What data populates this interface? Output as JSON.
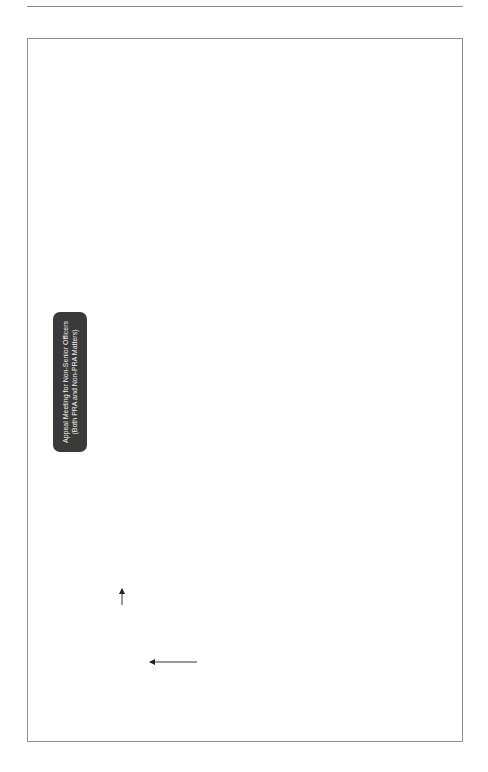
{
  "title": "Appeal Meeting for Non-Senior Officers\n(Both PRA and Non-PRA Matters)",
  "notes_label": "Notes",
  "edge_labels": {
    "yes": "Yes",
    "no": "No",
    "not_upheld": "Not upheld",
    "upheld": "Upheld"
  },
  "boxes": {
    "start": "Within 7WD of receipt of \"notice and summary of reasons notifying of outcome\" officer to give written notice of appeal to AA stating:\na) grounds for appeal (with details) and\nb) whether an appeal meeting is requested\nReg 38(1) PCR",
    "start_note": "* Officer has right of appeal against finding and/or outcome imposed at meeting\n* Grounds of appeal are:\na) Finding or disciplinary action was unreasonable\nb) Evidence that could not reasonably have been considered at the MC meeting\nc) Serious breach of the procedures/unfairness\n* Written notice must include details of why above applies\nReg 38(2) PCR\n2.230 - 2.233 G",
    "aa_appoints": "AA appoints person to conduct Appeal Meeting\nReg 38(4) PCR",
    "aa_appoints_note": "* Higher rank or more senior police staff member than that which heard the meeting\n* See additional rules under Reg 38(4) PCR\n* Police officer or police staff can be appointed to advise on procedural matters\n2.234 - 2.235 G",
    "aa_asap": "AA ASAP to give officer written notice of:\na) person appointed to conduct Appeal Meeting and\nb) any person appointed to advise\nReg 38(5) PCR",
    "officer_object": "Officer may object in writing (giving reasons) to AA within 3WD of notification) to:\na) person appointed to conduct appeal meeting or\nb) advisor\nReg 38(6) PCR",
    "officer_object_note": "Officer must provide clear and reasonable objections",
    "aa_decide": "AA to decide whether to uphold objection\nReg 38(8) PCR",
    "aa_replace": "AA to replace person and notify officer of the new persons name asap\nReg 38(9) PCR",
    "aa_notify_refusal": "AA to notify officer of refusal to uphold objection",
    "determine_arguable": "Person determining appeal determines whether the appeal sets out arguable grounds\nReg 39(2) PCR\n2.237 - 2.239 G",
    "dismiss": "Dismiss appeal\nReg 39(2)(b) PCR\n2.237 G",
    "dismiss_note": "* Inform officer of reasons and that there are no other avenues of appeal\n2.237 G",
    "specifies_dtp": "Person determining appeal specifies DTP of meeting\nOfficer/friend available?\nReg 39(2)(a) & Reg 39(4) - 6 PCR",
    "specifies_dtp_note": "Hold within 5WD of date determination made that notice of appeal sets out arguable grounds of appeal\nReg 39(2)(a) PCR",
    "officer_proposes": "Officer proposes alternative which is reasonable and within 5WD beginning after the day specified by person conducting Appeal Meeting\nReg 39(5) - (6) PCR",
    "written_notice_dtp": "Written Notice of DTP given to officer\nReg 39(7) PCR",
    "written_notice_dtp_note": "Also provide written notice to:\n* Complainant (if it was a complaint)\n* Any interested person under 2002 Act\nReg 39(7) PCR",
    "given_copies": "Person determining appeal given copies of all relevant documents\nReg 39(8) PCR",
    "given_copies_note": "* Relevant documents include:\na) Documents listed as per Reg 28(1) PCR\nb) Notice of Appeal\nc) Evidence that officer wishes to submit that was not considered at MC Meeting\nd) Record of MC Meeting\nReg 39(8) PCR",
    "own_procedure": "Person determining appeal determines own procedure and determines outcome\nReg 40(1) PCR",
    "own_procedure_note": "* Can confirm or reverse decision appealed against\n* Deal with officer in any manner as they could have done in the original MC meeting i.e. they may increase the outcome up to a FWW or make outcome less onerous\n* Interested parties or complainant may attend as an observer but not when considering disciplinary action\n* Can proceed in the absence of officer\n* Appeal is not a repeat of the MC Meeting. It is only to examine particular parts of the case which is under question and which may affect the finding or outcome\n2.242 G",
    "within_3wd": "Within 3WD give written notice of determination with a summary of reasons\nReg 40(5) - (6) PCR",
    "within_3wd_note": "* Substitutes any original decision but starts from date of original meeting\nReg 40(6) PCR\n* AA has duty to notify the Commission in certain circumstances\nReg 40(7) PCR"
  }
}
